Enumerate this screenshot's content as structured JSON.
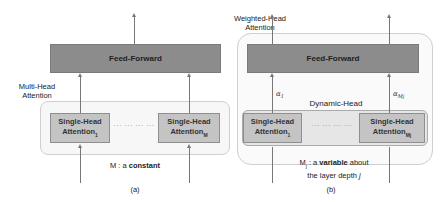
{
  "panel_a": {
    "feed_forward": "Feed-Forward",
    "side_label_line1": "Multi-Head",
    "side_label_line2": "Attention",
    "head_first_line1": "Single-Head",
    "head_first_line2": "Attention",
    "head_first_sub": "1",
    "head_last_line1": "Single-Head",
    "head_last_line2": "Attention",
    "head_last_sub": "M",
    "dots": "··· ··· ··· ···",
    "caption_prefix": "M : a ",
    "caption_bold": "constant",
    "panel_label": "(a)"
  },
  "panel_b": {
    "top_label_line1": "Weighted-Head",
    "top_label_line2": "Attention",
    "feed_forward": "Feed-Forward",
    "alpha_first": "α",
    "alpha_first_sub": "1",
    "alpha_last": "α",
    "alpha_last_sub": "Mj",
    "dynamic_head_label": "Dynamic-Head",
    "head_first_line1": "Single-Head",
    "head_first_line2": "Attention",
    "head_first_sub": "1",
    "head_last_line1": "Single-Head",
    "head_last_line2": "Attention",
    "head_last_sub": "Mj",
    "dots": "··· ··· ··· ···",
    "caption_m": "M",
    "caption_m_sub": "j",
    "caption_mid": " : a ",
    "caption_bold": "variable",
    "caption_suffix": " about",
    "caption_line2": "the layer depth ",
    "caption_j": "j",
    "panel_label": "(b)"
  }
}
